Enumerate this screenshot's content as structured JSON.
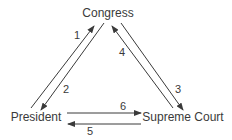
{
  "diagram": {
    "type": "triangle-flow",
    "nodes": [
      {
        "id": "congress",
        "label": "Congress",
        "x": 108,
        "y": 17
      },
      {
        "id": "president",
        "label": "President",
        "x": 36,
        "y": 121
      },
      {
        "id": "supreme_court",
        "label": "Supreme Court",
        "x": 183,
        "y": 121
      }
    ],
    "edges": [
      {
        "id": "1",
        "label": "1",
        "from": "president",
        "to": "congress",
        "x1": 31,
        "y1": 108,
        "x2": 94,
        "y2": 26,
        "lx": 77,
        "ly": 39
      },
      {
        "id": "2",
        "label": "2",
        "from": "congress",
        "to": "president",
        "x1": 104,
        "y1": 23,
        "x2": 41,
        "y2": 110,
        "lx": 66,
        "ly": 93
      },
      {
        "id": "3",
        "label": "3",
        "from": "congress",
        "to": "supreme_court",
        "x1": 121,
        "y1": 23,
        "x2": 183,
        "y2": 110,
        "lx": 178,
        "ly": 93
      },
      {
        "id": "4",
        "label": "4",
        "from": "supreme_court",
        "to": "congress",
        "x1": 173,
        "y1": 108,
        "x2": 112,
        "y2": 26,
        "lx": 122,
        "ly": 56
      },
      {
        "id": "5",
        "label": "5",
        "from": "supreme_court",
        "to": "president",
        "x1": 141,
        "y1": 124,
        "x2": 68,
        "y2": 124,
        "lx": 90,
        "ly": 135
      },
      {
        "id": "6",
        "label": "6",
        "from": "president",
        "to": "supreme_court",
        "x1": 67,
        "y1": 113,
        "x2": 141,
        "y2": 113,
        "lx": 123,
        "ly": 110
      }
    ],
    "colors": {
      "ink": "#3a3a3a",
      "background": "#ffffff"
    }
  }
}
